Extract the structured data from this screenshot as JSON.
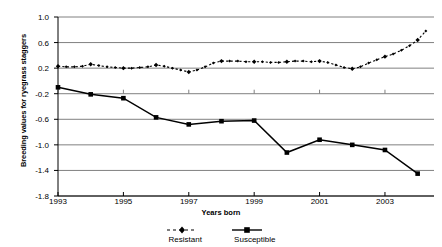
{
  "chart_data": {
    "type": "line",
    "title": "",
    "xlabel": "Years born",
    "ylabel": "Breeding values for ryegrass staggers",
    "xlim": [
      1993,
      2004.5
    ],
    "ylim": [
      -1.8,
      1.0
    ],
    "grid": true,
    "legend_position": "bottom",
    "x_ticks": [
      "1993",
      "1995",
      "1997",
      "1999",
      "2001",
      "2003"
    ],
    "x_tick_values": [
      1993,
      1995,
      1997,
      1999,
      2001,
      2003
    ],
    "y_ticks": [
      "1.0",
      "0.6",
      "0.2",
      "-0.2",
      "-0.6",
      "-1.0",
      "-1.4",
      "-1.8"
    ],
    "y_tick_values": [
      1.0,
      0.6,
      0.2,
      -0.2,
      -0.6,
      -1.0,
      -1.4,
      -1.8
    ],
    "series": [
      {
        "name": "Resistant",
        "style": "dotted",
        "marker": "diamond",
        "color": "#000000",
        "x": [
          1993,
          1993.25,
          1993.5,
          1993.75,
          1994,
          1994.25,
          1994.5,
          1994.75,
          1995,
          1995.25,
          1995.5,
          1995.75,
          1996,
          1996.25,
          1996.5,
          1996.75,
          1997,
          1997.25,
          1997.5,
          1997.75,
          1998,
          1998.25,
          1998.5,
          1998.75,
          1999,
          1999.25,
          1999.5,
          1999.75,
          2000,
          2000.25,
          2000.5,
          2000.75,
          2001,
          2001.25,
          2001.5,
          2001.75,
          2002,
          2002.25,
          2002.5,
          2002.75,
          2003,
          2003.25,
          2003.5,
          2003.75,
          2004,
          2004.25
        ],
        "y": [
          0.23,
          0.22,
          0.22,
          0.23,
          0.26,
          0.24,
          0.22,
          0.21,
          0.2,
          0.2,
          0.21,
          0.22,
          0.25,
          0.23,
          0.2,
          0.17,
          0.14,
          0.17,
          0.22,
          0.28,
          0.31,
          0.31,
          0.31,
          0.3,
          0.3,
          0.3,
          0.29,
          0.29,
          0.3,
          0.31,
          0.31,
          0.3,
          0.31,
          0.29,
          0.25,
          0.21,
          0.19,
          0.22,
          0.28,
          0.33,
          0.38,
          0.42,
          0.48,
          0.55,
          0.64,
          0.78
        ]
      },
      {
        "name": "Susceptible",
        "style": "solid",
        "marker": "square",
        "color": "#000000",
        "x": [
          1993,
          1994,
          1995,
          1996,
          1997,
          1998,
          1999,
          2000,
          2001,
          2002,
          2003,
          2004
        ],
        "y": [
          -0.1,
          -0.21,
          -0.27,
          -0.57,
          -0.68,
          -0.63,
          -0.62,
          -1.12,
          -0.92,
          -1.0,
          -1.08,
          -1.45
        ]
      }
    ]
  },
  "legend": {
    "resistant_label": "Resistant",
    "susceptible_label": "Susceptible"
  },
  "axes": {
    "y_title": "Breeding values for ryegrass staggers",
    "x_title": "Years born"
  },
  "colors": {
    "gridline": "#808080",
    "axis": "#000000",
    "series": "#000000",
    "background": "#ffffff"
  }
}
